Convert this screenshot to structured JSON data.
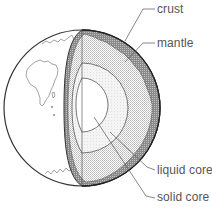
{
  "diagram": {
    "labels": {
      "crust": "crust",
      "mantle": "mantle",
      "liquid_core": "liquid core",
      "solid_core": "solid core"
    },
    "colors": {
      "outline": "#333333",
      "crust_fill": "#9a9a9a",
      "mantle_fill": "#d6d6d6",
      "liquid_core_fill": "#ececec",
      "solid_core_fill": "#ffffff",
      "label_text": "#555555",
      "leader_line": "#555555"
    }
  }
}
